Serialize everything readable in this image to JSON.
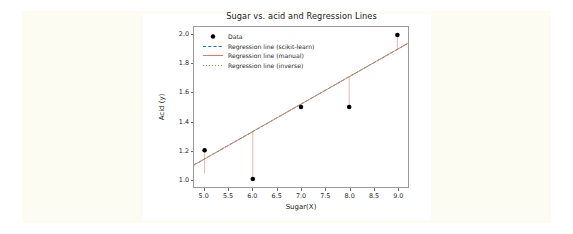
{
  "figure": {
    "background_color": "#fdfcf3",
    "canvas_color": "#ffffff"
  },
  "chart_data": {
    "type": "scatter",
    "title": "Sugar  vs. acid and Regression Lines",
    "xlabel": "Sugar(X)",
    "ylabel": "Acid (y)",
    "xlim": [
      4.78,
      9.22
    ],
    "ylim": [
      0.945,
      2.055
    ],
    "xticks": [
      5.0,
      5.5,
      6.0,
      6.5,
      7.0,
      7.5,
      8.0,
      8.5,
      9.0
    ],
    "xtick_labels": [
      "5.0",
      "5.5",
      "6.0",
      "6.5",
      "7.0",
      "7.5",
      "8.0",
      "8.5",
      "9.0"
    ],
    "yticks": [
      1.0,
      1.2,
      1.4,
      1.6,
      1.8,
      2.0
    ],
    "ytick_labels": [
      "1.0",
      "1.2",
      "1.4",
      "1.6",
      "1.8",
      "2.0"
    ],
    "grid": false,
    "legend_position": "upper left",
    "x": [
      5.0,
      6.0,
      7.0,
      8.0,
      9.0
    ],
    "y": [
      1.2,
      1.0,
      1.5,
      1.5,
      2.0
    ],
    "series": [
      {
        "name": "Data",
        "kind": "scatter",
        "color": "#000000",
        "marker": "o",
        "values": [
          1.2,
          1.0,
          1.5,
          1.5,
          2.0
        ]
      },
      {
        "name": "Regression line (scikit-learn)",
        "kind": "line",
        "color": "#1f77b4",
        "linestyle": "dashed",
        "slope": 0.19,
        "intercept": 0.19,
        "endpoints": [
          [
            4.78,
            1.098
          ],
          [
            9.22,
            1.942
          ]
        ]
      },
      {
        "name": "Regression line (manual)",
        "kind": "line",
        "color": "#e8736a",
        "linestyle": "solid",
        "slope": 0.19,
        "intercept": 0.19,
        "endpoints": [
          [
            4.78,
            1.098
          ],
          [
            9.22,
            1.942
          ]
        ]
      },
      {
        "name": "Regression line (inverse)",
        "kind": "line",
        "color": "#6aa84f",
        "linestyle": "dotted",
        "slope": 0.19,
        "intercept": 0.19,
        "endpoints": [
          [
            4.78,
            1.098
          ],
          [
            9.22,
            1.942
          ]
        ]
      }
    ],
    "residuals": {
      "name": "residual-lines",
      "color": "#eeaaa4",
      "segments": [
        {
          "x": 5.0,
          "y_point": 1.2,
          "y_fit": 1.04
        },
        {
          "x": 6.0,
          "y_point": 1.0,
          "y_fit": 1.33
        },
        {
          "x": 7.0,
          "y_point": 1.5,
          "y_fit": 1.52
        },
        {
          "x": 8.0,
          "y_point": 1.5,
          "y_fit": 1.71
        },
        {
          "x": 9.0,
          "y_point": 2.0,
          "y_fit": 1.9
        }
      ]
    },
    "legend": [
      {
        "label": "Data",
        "marker": "circle",
        "color": "#000000"
      },
      {
        "label": "Regression line (scikit-learn)",
        "marker": "dashed-line",
        "color": "#1f77b4"
      },
      {
        "label": "Regression line (manual)",
        "marker": "solid-line",
        "color": "#e8736a"
      },
      {
        "label": "Regression line (inverse)",
        "marker": "dotted-line",
        "color": "#6aa84f"
      }
    ]
  }
}
